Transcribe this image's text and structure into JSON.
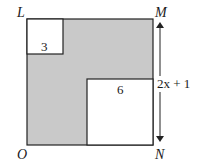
{
  "diagram": {
    "vertices": {
      "top_left": "L",
      "top_right": "M",
      "bottom_right": "N",
      "bottom_left": "O"
    },
    "small_square_label": "3",
    "large_square_label": "6",
    "side_label": "2x + 1",
    "colors": {
      "shaded": "#c9c9c9",
      "stroke": "#222222",
      "white": "#ffffff"
    }
  }
}
